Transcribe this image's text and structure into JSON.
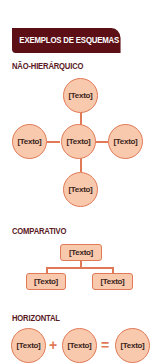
{
  "header": {
    "title": "EXEMPLOS DE ESQUEMAS"
  },
  "colors": {
    "banner": "#5c1016",
    "heading": "#5a1a1e",
    "node_fill": "#f9c9ad",
    "node_border": "#e07a56",
    "node_text": "#3a2420"
  },
  "sections": {
    "non_hierarchical": {
      "title": "NÃO-HIERÁRQUICO",
      "nodes": {
        "top": "[Texto]",
        "left": "[Texto]",
        "center": "[Texto]",
        "right": "[Texto]",
        "bottom": "[Texto]"
      }
    },
    "comparative": {
      "title": "COMPARATIVO",
      "nodes": {
        "top": "[Texto]",
        "bottom_left": "[Texto]",
        "bottom_right": "[Texto]"
      }
    },
    "horizontal": {
      "title": "HORIZONTAL",
      "nodes": [
        "[Texto]",
        "[Texto]",
        "[Texto]"
      ],
      "operators": [
        "+",
        "="
      ]
    }
  }
}
